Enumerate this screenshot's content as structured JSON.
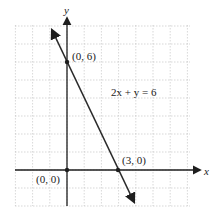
{
  "chart_data": {
    "type": "line",
    "title": "",
    "equation": "2x + y = 6",
    "xlabel": "x",
    "ylabel": "y",
    "grid": true,
    "xlim": [
      -3,
      7
    ],
    "ylim": [
      -2,
      8
    ],
    "series": [
      {
        "name": "2x + y = 6",
        "x": [
          -0.8,
          3.9
        ],
        "y": [
          7.6,
          -1.8
        ],
        "arrows": "both"
      }
    ],
    "points": [
      {
        "label": "(0, 6)",
        "x": 0,
        "y": 6
      },
      {
        "label": "(3, 0)",
        "x": 3,
        "y": 0
      },
      {
        "label": "(0, 0)",
        "x": 0,
        "y": 0
      }
    ]
  },
  "labels": {
    "x_axis": "x",
    "y_axis": "y",
    "equation": "2x + y = 6",
    "p06": "(0, 6)",
    "p30": "(3, 0)",
    "p00": "(0, 0)"
  },
  "colors": {
    "line": "#2a2a2a",
    "grid": "#bdbdbd",
    "axis": "#1e1e1e"
  }
}
